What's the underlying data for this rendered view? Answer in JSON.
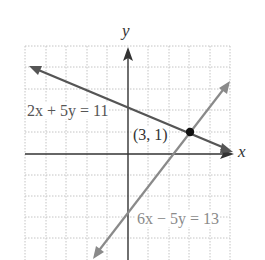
{
  "graph": {
    "x_axis_label": "x",
    "y_axis_label": "y",
    "x_range": [
      -5,
      5
    ],
    "y_range": [
      -5,
      5
    ],
    "grid": true,
    "colors": {
      "grid": "#bdbdbd",
      "axis": "#333333",
      "line1": "#555555",
      "line2": "#8a8a8a",
      "point": "#111111",
      "label1": "#555555",
      "label2": "#8a8a8a"
    }
  },
  "lines": [
    {
      "equation": "2x + 5y = 11",
      "label": "2x + 5y = 11"
    },
    {
      "equation": "6x − 5y = 13",
      "label": "6x − 5y = 13"
    }
  ],
  "intersection": {
    "x": 3,
    "y": 1,
    "label": "(3, 1)"
  }
}
